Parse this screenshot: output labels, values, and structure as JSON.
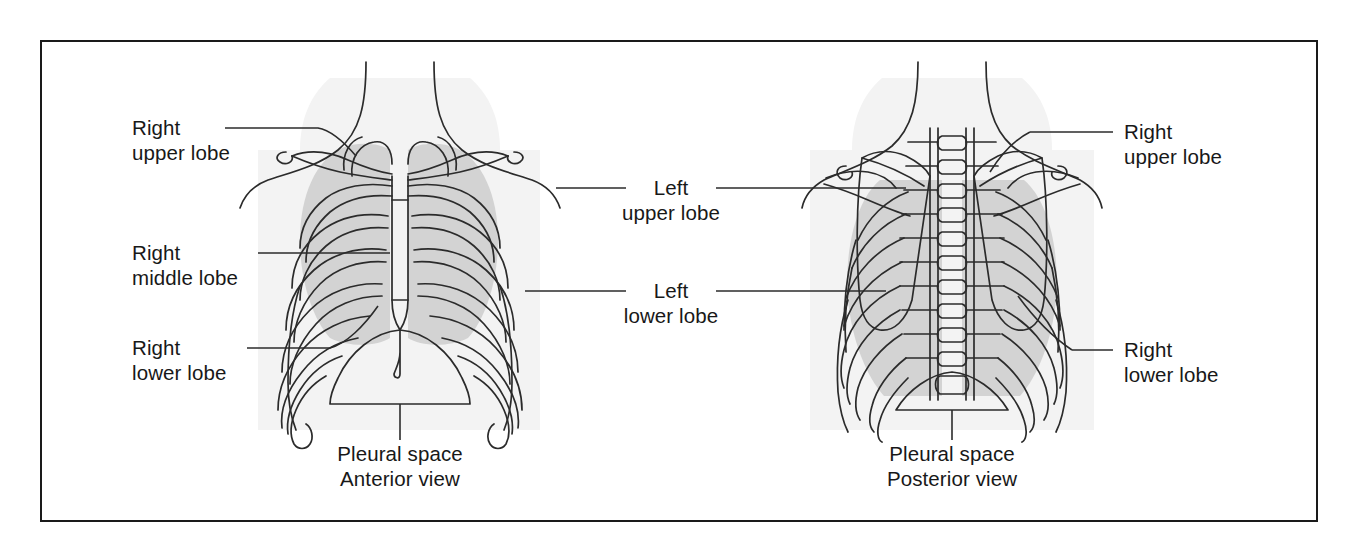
{
  "figure": {
    "border_color": "#1a1a1a",
    "background": "#ffffff",
    "lung_shade_color": "#d2d2d2",
    "body_shade_color": "#f2f2f2",
    "line_color": "#2b2b2b"
  },
  "labels": {
    "left_column": [
      {
        "id": "right-upper-lobe-left",
        "line1": "Right",
        "line2": "upper lobe"
      },
      {
        "id": "right-middle-lobe",
        "line1": "Right",
        "line2": "middle lobe"
      },
      {
        "id": "right-lower-lobe-left",
        "line1": "Right",
        "line2": "lower lobe"
      }
    ],
    "center_column": [
      {
        "id": "left-upper-lobe",
        "line1": "Left",
        "line2": "upper lobe"
      },
      {
        "id": "left-lower-lobe",
        "line1": "Left",
        "line2": "lower lobe"
      }
    ],
    "right_column": [
      {
        "id": "right-upper-lobe-right",
        "line1": "Right",
        "line2": "upper lobe"
      },
      {
        "id": "right-lower-lobe-right",
        "line1": "Right",
        "line2": "lower lobe"
      }
    ],
    "captions": [
      {
        "id": "anterior",
        "structure": "Pleural space",
        "view": "Anterior view"
      },
      {
        "id": "posterior",
        "structure": "Pleural space",
        "view": "Posterior view"
      }
    ]
  }
}
